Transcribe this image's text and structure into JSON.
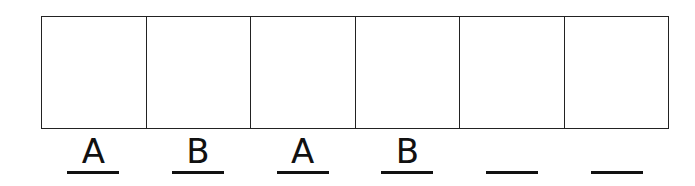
{
  "pattern": {
    "cells": [
      {
        "index": 1,
        "answer": "A"
      },
      {
        "index": 2,
        "answer": "B"
      },
      {
        "index": 3,
        "answer": "A"
      },
      {
        "index": 4,
        "answer": "B"
      },
      {
        "index": 5,
        "answer": ""
      },
      {
        "index": 6,
        "answer": ""
      }
    ]
  }
}
